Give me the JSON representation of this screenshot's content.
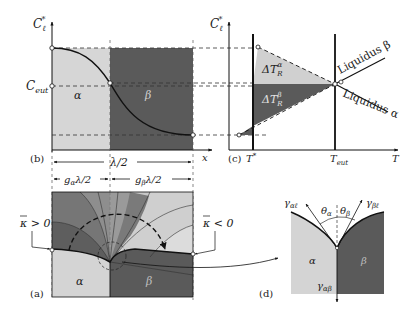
{
  "colors": {
    "alpha_phase": "#d6d6d6",
    "beta_phase": "#5a5a5a",
    "mid_gray": "#8c8c8c",
    "light_gray": "#c4c4c4",
    "line": "#111111",
    "dashed": "#333333",
    "background": "#ffffff"
  },
  "panel_b": {
    "tag": "(b)",
    "y_axis_label": "C",
    "y_axis_sub": "ℓ",
    "y_axis_sup": "*",
    "c_eut_label": "C",
    "c_eut_sub": "eut",
    "alpha_label": "α",
    "beta_label": "β",
    "x_axis_label": "x",
    "lambda_half": "λ/2",
    "g_alpha_label": "g",
    "g_alpha_sub": "α",
    "g_alpha_rest": "λ/2",
    "g_beta_label": "g",
    "g_beta_sub": "β",
    "g_beta_rest": "λ/2"
  },
  "panel_c": {
    "tag": "(c)",
    "y_axis_label": "C",
    "y_axis_sub": "ℓ",
    "y_axis_sup": "*",
    "t_star_label": "T",
    "t_star_sup": "*",
    "t_eut_label": "T",
    "t_eut_sub": "eut",
    "x_axis_label": "T",
    "delta_alpha": "ΔT",
    "delta_alpha_sub": "R",
    "delta_alpha_sup": "α",
    "delta_beta": "ΔT",
    "delta_beta_sub": "R",
    "delta_beta_sup": "β",
    "liquidus_beta": "Liquidus β",
    "liquidus_alpha": "Liquidus α"
  },
  "panel_a": {
    "tag": "(a)",
    "kappa_pos": "κ > 0",
    "kappa_neg": "κ < 0",
    "alpha_label": "α",
    "beta_label": "β"
  },
  "panel_d": {
    "tag": "(d)",
    "alpha_label": "α",
    "beta_label": "β",
    "gamma_al": "γ",
    "gamma_al_sub": "αℓ",
    "gamma_bl": "γ",
    "gamma_bl_sub": "βℓ",
    "gamma_ab": "γ",
    "gamma_ab_sub": "αβ",
    "theta_a": "θ",
    "theta_a_sub": "α",
    "theta_b": "θ",
    "theta_b_sub": "β"
  }
}
